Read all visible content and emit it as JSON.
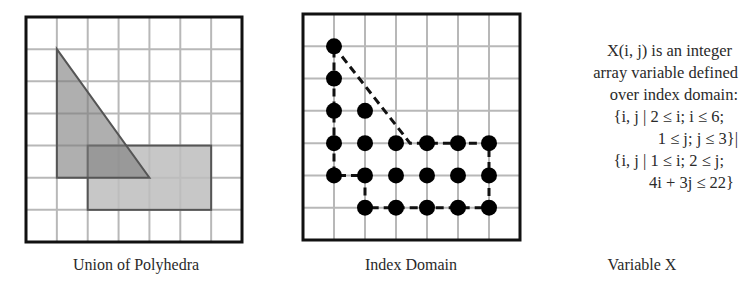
{
  "figure": {
    "panels": [
      {
        "id": "union-of-polyhedra",
        "caption": "Union of Polyhedra",
        "grid": {
          "cols": 7,
          "rows": 7
        },
        "shapes": [
          {
            "name": "triangle",
            "vertices_grid": [
              [
                1,
                1
              ],
              [
                1,
                5
              ],
              [
                4,
                5
              ]
            ],
            "fill": "#a9a9a9"
          },
          {
            "name": "rectangle",
            "from_grid": [
              2,
              4
            ],
            "to_grid": [
              6,
              6
            ],
            "fill": "#bdbdbd"
          }
        ]
      },
      {
        "id": "index-domain",
        "caption": "Index Domain",
        "grid": {
          "cols": 7,
          "rows": 7
        },
        "points_ij": [
          [
            1,
            6
          ],
          [
            1,
            5
          ],
          [
            1,
            4
          ],
          [
            2,
            4
          ],
          [
            1,
            3
          ],
          [
            2,
            3
          ],
          [
            3,
            3
          ],
          [
            4,
            3
          ],
          [
            5,
            3
          ],
          [
            6,
            3
          ],
          [
            1,
            2
          ],
          [
            2,
            2
          ],
          [
            3,
            2
          ],
          [
            4,
            2
          ],
          [
            5,
            2
          ],
          [
            6,
            2
          ],
          [
            2,
            1
          ],
          [
            3,
            1
          ],
          [
            4,
            1
          ],
          [
            5,
            1
          ],
          [
            6,
            1
          ]
        ],
        "outline_style": "dashed"
      },
      {
        "id": "variable-x",
        "caption": "Variable X",
        "text_lines": [
          "X(i, j) is an integer",
          "array variable defined",
          "over index domain:",
          "{i, j | 2 ≤ i; i ≤ 6;",
          "1 ≤ j; j ≤ 3}|",
          "{i, j | 1 ≤ i; 2 ≤ j;",
          "4i + 3j ≤ 22}"
        ]
      }
    ]
  }
}
